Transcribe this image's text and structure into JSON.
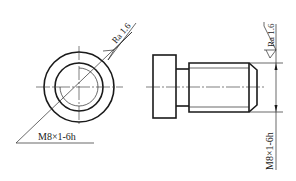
{
  "drawing": {
    "left_view": {
      "thread_label": "M8×1-6h",
      "roughness_label": "Ra 1.6"
    },
    "right_view": {
      "thread_label": "M8×1-6h",
      "roughness_label": "Ra 1.6"
    }
  }
}
